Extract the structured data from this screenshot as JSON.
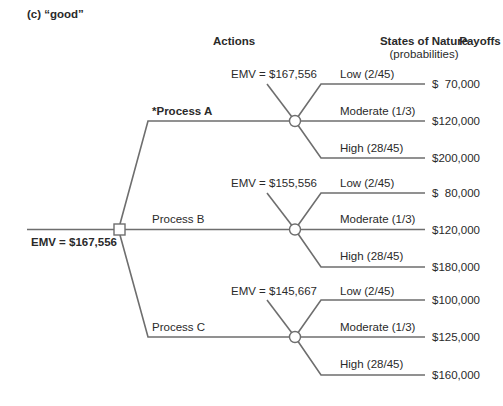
{
  "figure": {
    "caption": "(c) “good”",
    "headers": {
      "actions": "Actions",
      "states": "States of Nature",
      "states_sub": "(probabilities)",
      "payoffs": "Payoffs"
    },
    "decision_node": {
      "emv_label": "EMV = $167,556"
    },
    "actions": [
      {
        "label": "*Process A",
        "selected": true,
        "emv_label": "EMV = $167,556",
        "outcomes": [
          {
            "state": "Low (2/45)",
            "payoff": "$  70,000"
          },
          {
            "state": "Moderate (1/3)",
            "payoff": "$120,000"
          },
          {
            "state": "High (28/45)",
            "payoff": "$200,000"
          }
        ]
      },
      {
        "label": "Process B",
        "selected": false,
        "emv_label": "EMV = $155,556",
        "outcomes": [
          {
            "state": "Low (2/45)",
            "payoff": "$  80,000"
          },
          {
            "state": "Moderate (1/3)",
            "payoff": "$120,000"
          },
          {
            "state": "High (28/45)",
            "payoff": "$180,000"
          }
        ]
      },
      {
        "label": "Process C",
        "selected": false,
        "emv_label": "EMV = $145,667",
        "outcomes": [
          {
            "state": "Low (2/45)",
            "payoff": "$100,000"
          },
          {
            "state": "Moderate (1/3)",
            "payoff": "$125,000"
          },
          {
            "state": "High (28/45)",
            "payoff": "$160,000"
          }
        ]
      }
    ]
  }
}
